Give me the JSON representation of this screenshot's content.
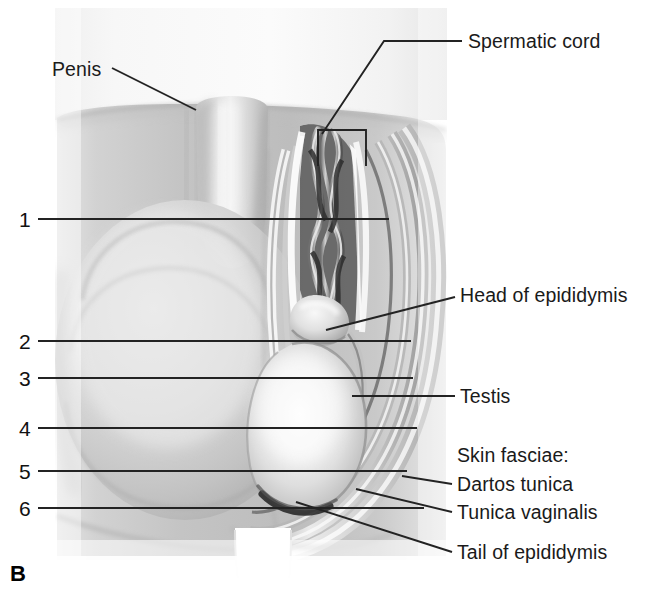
{
  "figure": {
    "panel_letter": "B"
  },
  "callout_labels": [
    {
      "id": "penis",
      "text": "Penis",
      "x": 52,
      "y": 60,
      "anchor": "left"
    },
    {
      "id": "spermatic-cord",
      "text": "Spermatic cord",
      "x": 468,
      "y": 32,
      "anchor": "left"
    },
    {
      "id": "head-epididymis",
      "text": "Head of epididymis",
      "x": 460,
      "y": 286,
      "anchor": "left"
    },
    {
      "id": "testis",
      "text": "Testis",
      "x": 460,
      "y": 387,
      "anchor": "left"
    },
    {
      "id": "skin-fasciae",
      "text": "Skin fasciae:",
      "x": 457,
      "y": 446,
      "anchor": "left"
    },
    {
      "id": "dartos-tunica",
      "text": "Dartos tunica",
      "x": 457,
      "y": 475,
      "anchor": "left"
    },
    {
      "id": "tunica-vaginalis",
      "text": "Tunica vaginalis",
      "x": 457,
      "y": 503,
      "anchor": "left"
    },
    {
      "id": "tail-epididymis",
      "text": "Tail of epididymis",
      "x": 457,
      "y": 543,
      "anchor": "left"
    }
  ],
  "numbered_leaders": [
    {
      "number": "1",
      "num_x": 19,
      "num_y": 209,
      "line_y": 219,
      "line_x1": 38,
      "line_x2": 389
    },
    {
      "number": "2",
      "num_x": 19,
      "num_y": 331,
      "line_y": 341,
      "line_x1": 38,
      "line_x2": 411
    },
    {
      "number": "3",
      "num_x": 19,
      "num_y": 368,
      "line_y": 378,
      "line_x1": 38,
      "line_x2": 413
    },
    {
      "number": "4",
      "num_x": 19,
      "num_y": 418,
      "line_y": 428,
      "line_x1": 38,
      "line_x2": 417
    },
    {
      "number": "5",
      "num_x": 19,
      "num_y": 461,
      "line_y": 471,
      "line_x1": 38,
      "line_x2": 407
    },
    {
      "number": "6",
      "num_x": 19,
      "num_y": 498,
      "line_y": 508,
      "line_x1": 38,
      "line_x2": 424
    }
  ],
  "colors": {
    "line": "#232323",
    "text": "#151515",
    "background": "#ffffff",
    "skin_light": "#e9e9e9",
    "skin_mid": "#c9c9c9",
    "skin_dark": "#9b9b9b",
    "testis_highlight": "#f4f4f4",
    "cord_dark": "#3a3a3a"
  }
}
